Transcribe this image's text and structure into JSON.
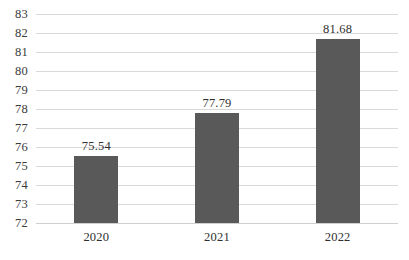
{
  "chart_data": {
    "type": "bar",
    "title": "",
    "subtitle": "",
    "xlabel": "",
    "ylabel": "",
    "categories": [
      "2020",
      "2021",
      "2022"
    ],
    "values": [
      75.54,
      77.79,
      81.68
    ],
    "data_labels": [
      "75.54",
      "77.79",
      "81.68"
    ],
    "ylim": [
      72,
      83
    ],
    "y_ticks": [
      72,
      73,
      74,
      75,
      76,
      77,
      78,
      79,
      80,
      81,
      82,
      83
    ],
    "y_tick_labels": [
      "72",
      "73",
      "74",
      "75",
      "76",
      "77",
      "78",
      "79",
      "80",
      "81",
      "82",
      "83"
    ],
    "grid": "horizontal",
    "legend": "none",
    "series": [
      {
        "name": "",
        "values": [
          75.54,
          77.79,
          81.68
        ]
      }
    ],
    "colors": {
      "bar": "#595959",
      "gridline": "#d9d9d9",
      "baseline": "#cfcfcf",
      "tick_label": "#3b3b3b",
      "data_label": "#2f2f2f",
      "background": "#ffffff"
    }
  }
}
